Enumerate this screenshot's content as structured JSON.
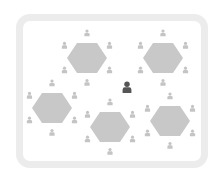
{
  "diagram": {
    "title": "",
    "colors": {
      "frame": "#ececec",
      "table": "#c8c8c8",
      "seat": "#c4c4c4",
      "focus_person": "#555555"
    },
    "tables": [
      {
        "id": "table-1",
        "cx": 87,
        "cy": 58,
        "r": 20
      },
      {
        "id": "table-2",
        "cx": 163,
        "cy": 58,
        "r": 20
      },
      {
        "id": "table-3",
        "cx": 52,
        "cy": 108,
        "r": 20
      },
      {
        "id": "table-4",
        "cx": 110,
        "cy": 127,
        "r": 20
      },
      {
        "id": "table-5",
        "cx": 170,
        "cy": 121,
        "r": 20
      }
    ],
    "seats_per_table": 6,
    "focus_person": {
      "x": 127,
      "y": 88
    }
  }
}
